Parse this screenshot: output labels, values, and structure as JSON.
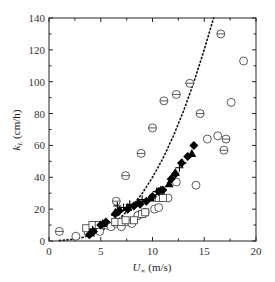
{
  "chart_data": {
    "type": "scatter",
    "title": "",
    "xlabel": "U∞ (m/s)",
    "ylabel": "kL (cm/h)",
    "xlim": [
      0,
      20
    ],
    "ylim": [
      0,
      140
    ],
    "xticks": [
      0,
      5,
      10,
      15,
      20
    ],
    "yticks": [
      0,
      20,
      40,
      60,
      80,
      100,
      120,
      140
    ],
    "grid": false,
    "legend": null,
    "series": [
      {
        "name": "circle-minus",
        "marker": "circle-with-bar",
        "points": [
          [
            1.0,
            6
          ],
          [
            6.5,
            25
          ],
          [
            7.4,
            41
          ],
          [
            8.6,
            16
          ],
          [
            8.9,
            55
          ],
          [
            10.0,
            71
          ],
          [
            11.1,
            88
          ],
          [
            12.3,
            92
          ],
          [
            13.6,
            99
          ],
          [
            14.6,
            80
          ],
          [
            16.6,
            130
          ],
          [
            16.9,
            57
          ],
          [
            17.1,
            64
          ]
        ]
      },
      {
        "name": "open-circle",
        "marker": "circle",
        "points": [
          [
            2.6,
            3
          ],
          [
            3.8,
            5
          ],
          [
            4.3,
            8
          ],
          [
            4.9,
            6
          ],
          [
            5.6,
            10
          ],
          [
            6.0,
            9
          ],
          [
            6.5,
            11
          ],
          [
            7.0,
            9
          ],
          [
            7.4,
            12
          ],
          [
            8.0,
            11
          ],
          [
            8.6,
            16
          ],
          [
            9.3,
            18
          ],
          [
            10.2,
            20
          ],
          [
            10.6,
            21
          ],
          [
            11.5,
            27
          ],
          [
            12.3,
            37
          ],
          [
            14.2,
            35
          ],
          [
            15.3,
            64
          ],
          [
            16.3,
            66
          ],
          [
            17.6,
            87
          ],
          [
            18.8,
            113
          ]
        ]
      },
      {
        "name": "open-square",
        "marker": "square",
        "points": [
          [
            3.6,
            8
          ],
          [
            4.2,
            10
          ],
          [
            4.8,
            10
          ],
          [
            6.4,
            12
          ],
          [
            7.0,
            12
          ],
          [
            7.4,
            13
          ],
          [
            8.2,
            13
          ],
          [
            9.0,
            17
          ],
          [
            9.3,
            18
          ],
          [
            10.6,
            27
          ],
          [
            11.0,
            27
          ]
        ]
      },
      {
        "name": "filled-diamond",
        "marker": "diamond-filled",
        "points": [
          [
            3.9,
            4
          ],
          [
            4.3,
            6
          ],
          [
            5.0,
            10
          ],
          [
            5.5,
            12
          ],
          [
            6.4,
            17
          ],
          [
            6.8,
            19
          ],
          [
            7.6,
            20
          ],
          [
            8.2,
            22
          ],
          [
            8.8,
            23
          ],
          [
            9.4,
            25
          ],
          [
            10.0,
            28
          ],
          [
            10.6,
            31
          ],
          [
            11.0,
            32
          ],
          [
            11.8,
            39
          ],
          [
            12.2,
            42
          ],
          [
            12.8,
            49
          ],
          [
            13.4,
            53
          ],
          [
            14.0,
            60
          ]
        ]
      },
      {
        "name": "filled-triangle",
        "marker": "triangle-filled",
        "points": [
          [
            4.0,
            5
          ],
          [
            5.2,
            11
          ],
          [
            6.4,
            18
          ],
          [
            7.6,
            21
          ],
          [
            8.6,
            24
          ],
          [
            9.8,
            27
          ],
          [
            10.8,
            32
          ],
          [
            11.6,
            36
          ],
          [
            12.2,
            43
          ],
          [
            13.8,
            55
          ]
        ]
      },
      {
        "name": "plus",
        "marker": "plus",
        "points": [
          [
            4.2,
            7
          ],
          [
            6.6,
            22
          ],
          [
            7.2,
            21
          ],
          [
            7.8,
            23
          ],
          [
            9.0,
            26
          ],
          [
            10.4,
            31
          ],
          [
            12.6,
            46
          ],
          [
            12.9,
            49
          ]
        ]
      }
    ],
    "fit_curve": {
      "style": "dotted",
      "points": [
        [
          1.0,
          0.3
        ],
        [
          2.0,
          0.8
        ],
        [
          3.0,
          1.8
        ],
        [
          4.0,
          3.6
        ],
        [
          5.0,
          6.3
        ],
        [
          6.0,
          10.1
        ],
        [
          7.0,
          15.2
        ],
        [
          8.0,
          21.7
        ],
        [
          9.0,
          29.9
        ],
        [
          10.0,
          40.0
        ],
        [
          11.0,
          51.8
        ],
        [
          12.0,
          65.7
        ],
        [
          13.0,
          81.7
        ],
        [
          14.0,
          99.8
        ],
        [
          15.0,
          120.2
        ],
        [
          15.9,
          140.0
        ]
      ]
    }
  },
  "axes": {
    "x_label_main": "U",
    "x_label_sub": "∞",
    "x_label_unit": " (m/s)",
    "y_label_main": "k",
    "y_label_sub": "L",
    "y_label_unit": " (cm/h)"
  }
}
